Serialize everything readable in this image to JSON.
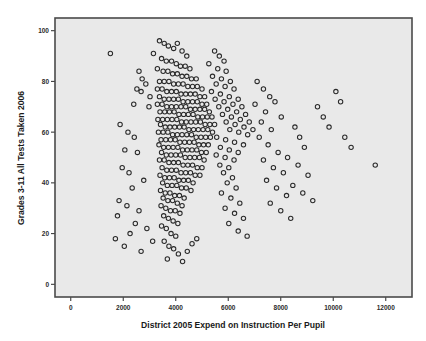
{
  "figure": {
    "background_color": "#ffffff",
    "plot_background_color": "#e9e9e9",
    "frame_color": "#4a4a4a",
    "marker_color": "#2a2a2a"
  },
  "chart_data": {
    "type": "scatter",
    "title": "",
    "xlabel": "District 2005 Expend on Instruction Per Pupil",
    "ylabel": "Grades 3-11 All Tests Taken 2006",
    "xlim": [
      -600,
      13000
    ],
    "ylim": [
      -5,
      105
    ],
    "xticks": [
      0,
      2000,
      4000,
      6000,
      8000,
      10000,
      12000
    ],
    "xtick_labels": [
      "0",
      "2000",
      "4000",
      "6000",
      "8000",
      "10000",
      "12000"
    ],
    "yticks": [
      0,
      20,
      40,
      60,
      80,
      100
    ],
    "ytick_labels": [
      "0",
      "20",
      "40",
      "60",
      "80",
      "100"
    ],
    "grid": false,
    "legend": null,
    "marker": {
      "shape": "open-circle",
      "radius": 2.2,
      "edge_color": "#2a2a2a",
      "fill": "none"
    },
    "n_points": 330,
    "points": [
      [
        1510,
        91
      ],
      [
        3150,
        91
      ],
      [
        2600,
        84
      ],
      [
        2720,
        81
      ],
      [
        2860,
        79
      ],
      [
        2520,
        77
      ],
      [
        2680,
        76
      ],
      [
        3020,
        74
      ],
      [
        2400,
        71
      ],
      [
        2980,
        70
      ],
      [
        1880,
        63
      ],
      [
        2180,
        60
      ],
      [
        2420,
        58
      ],
      [
        2060,
        53
      ],
      [
        2540,
        52
      ],
      [
        1960,
        46
      ],
      [
        2220,
        44
      ],
      [
        2780,
        41
      ],
      [
        2340,
        38
      ],
      [
        1840,
        33
      ],
      [
        2140,
        31
      ],
      [
        2600,
        29
      ],
      [
        1780,
        27
      ],
      [
        2460,
        24
      ],
      [
        2900,
        22
      ],
      [
        2260,
        20
      ],
      [
        1700,
        18
      ],
      [
        2040,
        15
      ],
      [
        2680,
        13
      ],
      [
        3120,
        17
      ],
      [
        3380,
        96
      ],
      [
        3560,
        95
      ],
      [
        3720,
        94
      ],
      [
        3920,
        93
      ],
      [
        4060,
        95
      ],
      [
        4240,
        92
      ],
      [
        4420,
        90
      ],
      [
        3460,
        89
      ],
      [
        3640,
        88
      ],
      [
        3840,
        88
      ],
      [
        4020,
        87
      ],
      [
        4180,
        86
      ],
      [
        4360,
        86
      ],
      [
        4540,
        85
      ],
      [
        3300,
        85
      ],
      [
        3520,
        84
      ],
      [
        3700,
        84
      ],
      [
        3880,
        83
      ],
      [
        4060,
        83
      ],
      [
        4240,
        82
      ],
      [
        4420,
        82
      ],
      [
        4600,
        81
      ],
      [
        4780,
        81
      ],
      [
        3380,
        80
      ],
      [
        3560,
        80
      ],
      [
        3740,
        80
      ],
      [
        3920,
        79
      ],
      [
        4100,
        79
      ],
      [
        4280,
        79
      ],
      [
        4460,
        78
      ],
      [
        4640,
        78
      ],
      [
        4820,
        78
      ],
      [
        5000,
        77
      ],
      [
        3300,
        77
      ],
      [
        3480,
        77
      ],
      [
        3660,
        76
      ],
      [
        3840,
        76
      ],
      [
        4020,
        76
      ],
      [
        4200,
        75
      ],
      [
        4380,
        75
      ],
      [
        4560,
        75
      ],
      [
        4740,
        75
      ],
      [
        4920,
        74
      ],
      [
        5100,
        74
      ],
      [
        3380,
        74
      ],
      [
        3560,
        73
      ],
      [
        3740,
        73
      ],
      [
        3920,
        73
      ],
      [
        4100,
        73
      ],
      [
        4280,
        72
      ],
      [
        4460,
        72
      ],
      [
        4640,
        72
      ],
      [
        4820,
        72
      ],
      [
        5000,
        71
      ],
      [
        5180,
        71
      ],
      [
        3300,
        71
      ],
      [
        3480,
        71
      ],
      [
        3660,
        70
      ],
      [
        3840,
        70
      ],
      [
        4020,
        70
      ],
      [
        4200,
        70
      ],
      [
        4380,
        70
      ],
      [
        4560,
        69
      ],
      [
        4740,
        69
      ],
      [
        4920,
        69
      ],
      [
        5100,
        69
      ],
      [
        5280,
        68
      ],
      [
        3400,
        68
      ],
      [
        3580,
        68
      ],
      [
        3760,
        68
      ],
      [
        3940,
        68
      ],
      [
        4120,
        67
      ],
      [
        4300,
        67
      ],
      [
        4480,
        67
      ],
      [
        4660,
        67
      ],
      [
        4840,
        66
      ],
      [
        5020,
        66
      ],
      [
        5200,
        66
      ],
      [
        5380,
        66
      ],
      [
        3320,
        65
      ],
      [
        3500,
        65
      ],
      [
        3680,
        65
      ],
      [
        3860,
        65
      ],
      [
        4040,
        65
      ],
      [
        4220,
        64
      ],
      [
        4400,
        64
      ],
      [
        4580,
        64
      ],
      [
        4760,
        64
      ],
      [
        4940,
        64
      ],
      [
        5120,
        63
      ],
      [
        5300,
        63
      ],
      [
        5480,
        63
      ],
      [
        3420,
        63
      ],
      [
        3600,
        62
      ],
      [
        3780,
        62
      ],
      [
        3960,
        62
      ],
      [
        4140,
        62
      ],
      [
        4320,
        62
      ],
      [
        4500,
        61
      ],
      [
        4680,
        61
      ],
      [
        4860,
        61
      ],
      [
        5040,
        61
      ],
      [
        5220,
        61
      ],
      [
        5400,
        60
      ],
      [
        3340,
        60
      ],
      [
        3520,
        60
      ],
      [
        3700,
        60
      ],
      [
        3880,
        59
      ],
      [
        4060,
        59
      ],
      [
        4240,
        59
      ],
      [
        4420,
        59
      ],
      [
        4600,
        59
      ],
      [
        4780,
        58
      ],
      [
        4960,
        58
      ],
      [
        5140,
        58
      ],
      [
        5320,
        58
      ],
      [
        3440,
        57
      ],
      [
        3620,
        57
      ],
      [
        3800,
        57
      ],
      [
        3980,
        57
      ],
      [
        4160,
        56
      ],
      [
        4340,
        56
      ],
      [
        4520,
        56
      ],
      [
        4700,
        56
      ],
      [
        4880,
        55
      ],
      [
        5060,
        55
      ],
      [
        5240,
        55
      ],
      [
        3360,
        55
      ],
      [
        3540,
        54
      ],
      [
        3720,
        54
      ],
      [
        3900,
        54
      ],
      [
        4080,
        54
      ],
      [
        4260,
        53
      ],
      [
        4440,
        53
      ],
      [
        4620,
        53
      ],
      [
        4800,
        53
      ],
      [
        4980,
        52
      ],
      [
        5160,
        52
      ],
      [
        3460,
        52
      ],
      [
        3640,
        51
      ],
      [
        3820,
        51
      ],
      [
        4000,
        51
      ],
      [
        4180,
        51
      ],
      [
        4360,
        50
      ],
      [
        4540,
        50
      ],
      [
        4720,
        50
      ],
      [
        4900,
        50
      ],
      [
        5080,
        49
      ],
      [
        3380,
        49
      ],
      [
        3560,
        49
      ],
      [
        3740,
        48
      ],
      [
        3920,
        48
      ],
      [
        4100,
        48
      ],
      [
        4280,
        47
      ],
      [
        4460,
        47
      ],
      [
        4640,
        47
      ],
      [
        4820,
        46
      ],
      [
        5000,
        46
      ],
      [
        3480,
        46
      ],
      [
        3660,
        45
      ],
      [
        3840,
        45
      ],
      [
        4020,
        45
      ],
      [
        4200,
        44
      ],
      [
        4380,
        44
      ],
      [
        4560,
        44
      ],
      [
        4740,
        43
      ],
      [
        4920,
        43
      ],
      [
        3400,
        43
      ],
      [
        3580,
        42
      ],
      [
        3760,
        42
      ],
      [
        3940,
        42
      ],
      [
        4120,
        41
      ],
      [
        4300,
        41
      ],
      [
        4480,
        41
      ],
      [
        4660,
        40
      ],
      [
        3500,
        40
      ],
      [
        3680,
        39
      ],
      [
        3860,
        39
      ],
      [
        4040,
        39
      ],
      [
        4220,
        38
      ],
      [
        4400,
        38
      ],
      [
        4580,
        37
      ],
      [
        3420,
        37
      ],
      [
        3600,
        36
      ],
      [
        3780,
        36
      ],
      [
        3960,
        35
      ],
      [
        4140,
        35
      ],
      [
        4320,
        34
      ],
      [
        3520,
        34
      ],
      [
        3700,
        33
      ],
      [
        3880,
        33
      ],
      [
        4060,
        32
      ],
      [
        4240,
        31
      ],
      [
        3440,
        31
      ],
      [
        3620,
        30
      ],
      [
        3800,
        29
      ],
      [
        3980,
        29
      ],
      [
        4160,
        28
      ],
      [
        3540,
        27
      ],
      [
        3720,
        26
      ],
      [
        3900,
        25
      ],
      [
        4080,
        24
      ],
      [
        3460,
        23
      ],
      [
        3640,
        22
      ],
      [
        3820,
        20
      ],
      [
        4000,
        19
      ],
      [
        3560,
        17
      ],
      [
        3740,
        15
      ],
      [
        3920,
        14
      ],
      [
        4100,
        12
      ],
      [
        3680,
        10
      ],
      [
        4260,
        9
      ],
      [
        4440,
        13
      ],
      [
        4620,
        16
      ],
      [
        4800,
        18
      ],
      [
        5480,
        92
      ],
      [
        5660,
        90
      ],
      [
        5840,
        88
      ],
      [
        5260,
        87
      ],
      [
        5600,
        85
      ],
      [
        5920,
        84
      ],
      [
        5400,
        82
      ],
      [
        5740,
        81
      ],
      [
        6080,
        80
      ],
      [
        5540,
        79
      ],
      [
        5880,
        78
      ],
      [
        6220,
        77
      ],
      [
        5360,
        76
      ],
      [
        5700,
        75
      ],
      [
        6040,
        74
      ],
      [
        6380,
        73
      ],
      [
        5500,
        73
      ],
      [
        5840,
        72
      ],
      [
        6180,
        71
      ],
      [
        6520,
        70
      ],
      [
        5640,
        70
      ],
      [
        5980,
        69
      ],
      [
        6320,
        68
      ],
      [
        6660,
        67
      ],
      [
        5780,
        67
      ],
      [
        6120,
        66
      ],
      [
        6460,
        65
      ],
      [
        6800,
        64
      ],
      [
        5920,
        64
      ],
      [
        6260,
        63
      ],
      [
        6600,
        62
      ],
      [
        6940,
        61
      ],
      [
        6060,
        61
      ],
      [
        6400,
        60
      ],
      [
        6740,
        59
      ],
      [
        5560,
        58
      ],
      [
        5900,
        57
      ],
      [
        6240,
        56
      ],
      [
        6580,
        55
      ],
      [
        5700,
        54
      ],
      [
        6040,
        53
      ],
      [
        6380,
        52
      ],
      [
        5540,
        51
      ],
      [
        5880,
        50
      ],
      [
        6220,
        49
      ],
      [
        5680,
        47
      ],
      [
        6020,
        46
      ],
      [
        5820,
        44
      ],
      [
        6160,
        42
      ],
      [
        5960,
        40
      ],
      [
        6300,
        38
      ],
      [
        5740,
        36
      ],
      [
        6100,
        34
      ],
      [
        6440,
        32
      ],
      [
        5880,
        30
      ],
      [
        6240,
        28
      ],
      [
        6580,
        26
      ],
      [
        6020,
        24
      ],
      [
        6380,
        21
      ],
      [
        6720,
        19
      ],
      [
        7100,
        80
      ],
      [
        7340,
        77
      ],
      [
        7580,
        74
      ],
      [
        7020,
        71
      ],
      [
        7420,
        68
      ],
      [
        7780,
        72
      ],
      [
        7260,
        64
      ],
      [
        7640,
        61
      ],
      [
        8020,
        66
      ],
      [
        7180,
        58
      ],
      [
        7520,
        55
      ],
      [
        7900,
        52
      ],
      [
        7340,
        49
      ],
      [
        7720,
        46
      ],
      [
        8100,
        44
      ],
      [
        7460,
        41
      ],
      [
        7840,
        38
      ],
      [
        8220,
        35
      ],
      [
        7600,
        32
      ],
      [
        8000,
        29
      ],
      [
        8380,
        26
      ],
      [
        8540,
        62
      ],
      [
        8720,
        58
      ],
      [
        8900,
        54
      ],
      [
        8260,
        50
      ],
      [
        8660,
        47
      ],
      [
        9040,
        43
      ],
      [
        8460,
        39
      ],
      [
        8840,
        36
      ],
      [
        9220,
        33
      ],
      [
        9400,
        70
      ],
      [
        9620,
        66
      ],
      [
        9840,
        62
      ],
      [
        10100,
        76
      ],
      [
        10280,
        72
      ],
      [
        10440,
        58
      ],
      [
        10680,
        54
      ],
      [
        11600,
        47
      ]
    ]
  },
  "axis": {
    "x_title": "District 2005 Expend on Instruction Per Pupil",
    "y_title": "Grades 3-11 All Tests Taken 2006"
  }
}
